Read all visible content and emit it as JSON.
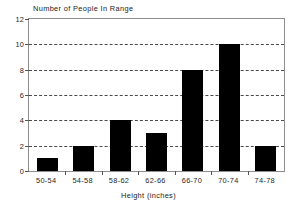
{
  "chart_data": {
    "type": "bar",
    "title": "Number of People In Range",
    "xlabel": "Height (inches)",
    "ylabel": "",
    "categories": [
      "50-54",
      "54-58",
      "58-62",
      "62-66",
      "66-70",
      "70-74",
      "74-78"
    ],
    "values": [
      1,
      2,
      4,
      3,
      8,
      10,
      2
    ],
    "ylim": [
      0,
      12
    ],
    "ytick_labels": [
      "0",
      "2",
      "4",
      "6",
      "8",
      "10",
      "12"
    ],
    "ytick_values": [
      0,
      2,
      4,
      6,
      8,
      10,
      12
    ],
    "grid": "horizontal-dashed",
    "legend": "none",
    "bar_color": "#000000",
    "background_color": "#ffffff",
    "axis_color": "#8d8d8d",
    "grid_color": "#4a4a4a"
  }
}
